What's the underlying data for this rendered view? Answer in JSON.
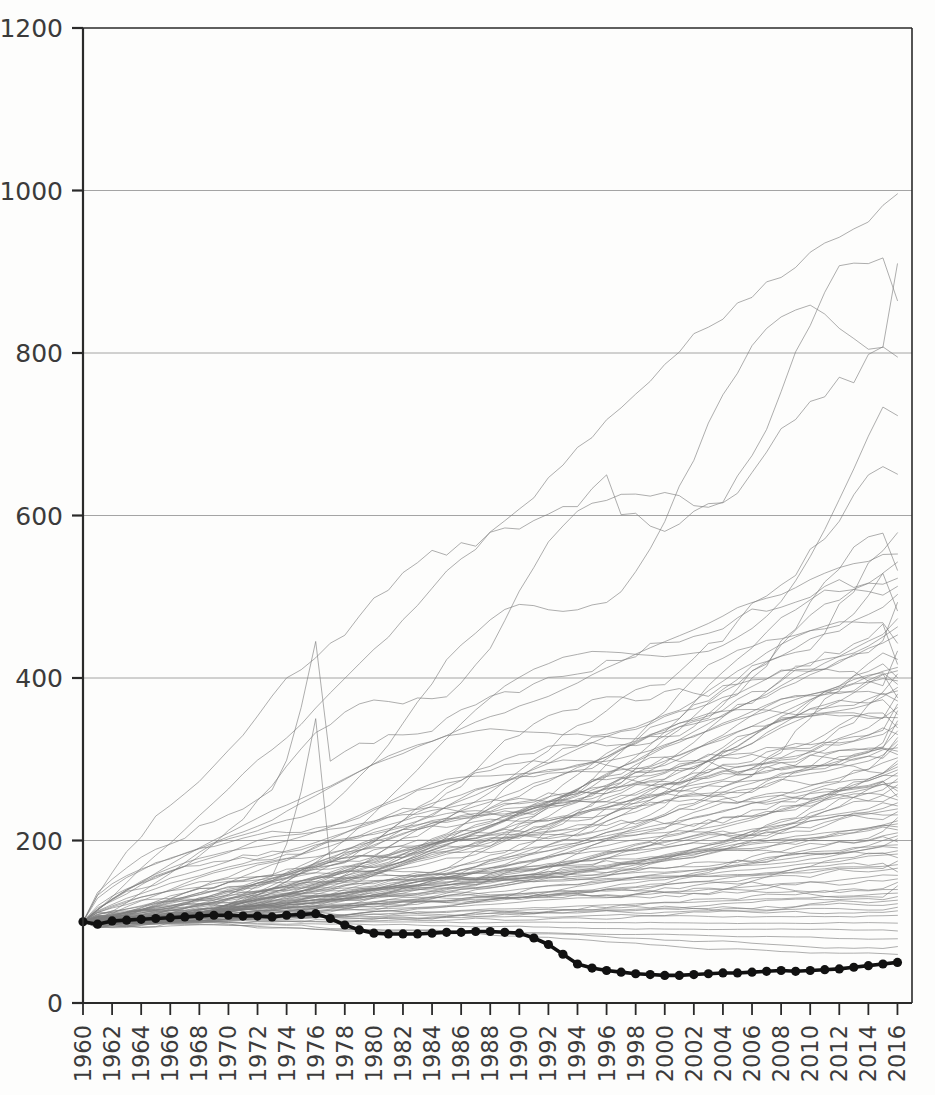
{
  "chart_data": {
    "type": "line",
    "title": "",
    "subtitle": "",
    "xlabel": "",
    "ylabel": "",
    "xlim": [
      1960,
      2017
    ],
    "ylim": [
      0,
      1200
    ],
    "yticks": [
      0,
      200,
      400,
      600,
      800,
      1000,
      1200
    ],
    "ytick_labels": [
      "0",
      "200",
      "400",
      "600",
      "800",
      "1000",
      "1200"
    ],
    "xticks": [
      1960,
      1962,
      1964,
      1966,
      1968,
      1970,
      1972,
      1974,
      1976,
      1978,
      1980,
      1982,
      1984,
      1986,
      1988,
      1990,
      1992,
      1994,
      1996,
      1998,
      2000,
      2002,
      2004,
      2006,
      2008,
      2010,
      2012,
      2014,
      2016
    ],
    "xtick_labels": [
      "1960",
      "1962",
      "1964",
      "1966",
      "1968",
      "1970",
      "1972",
      "1974",
      "1976",
      "1978",
      "1980",
      "1982",
      "1984",
      "1986",
      "1988",
      "1990",
      "1992",
      "1994",
      "1996",
      "1998",
      "2000",
      "2002",
      "2004",
      "2006",
      "2008",
      "2010",
      "2012",
      "2014",
      "2016"
    ],
    "xtick_rotation": 90,
    "grid": "horizontal",
    "grid_color": "#9a9a9a",
    "axis_color": "#2a2a2a",
    "background_color": "#fdfdfc",
    "index_base_year": 1960,
    "index_base_value": 100,
    "x": [
      1960,
      1961,
      1962,
      1963,
      1964,
      1965,
      1966,
      1967,
      1968,
      1969,
      1970,
      1971,
      1972,
      1973,
      1974,
      1975,
      1976,
      1977,
      1978,
      1979,
      1980,
      1981,
      1982,
      1983,
      1984,
      1985,
      1986,
      1987,
      1988,
      1989,
      1990,
      1991,
      1992,
      1993,
      1994,
      1995,
      1996,
      1997,
      1998,
      1999,
      2000,
      2001,
      2002,
      2003,
      2004,
      2005,
      2006,
      2007,
      2008,
      2009,
      2010,
      2011,
      2012,
      2013,
      2014,
      2015,
      2016
    ],
    "highlight_series": {
      "name": "highlighted-series",
      "color": "#111111",
      "line_width": 3.6,
      "marker": "circle",
      "marker_size": 4.6,
      "values": [
        100,
        97,
        101,
        102,
        103,
        104,
        105,
        106,
        107,
        108,
        108,
        107,
        107,
        106,
        108,
        109,
        110,
        104,
        96,
        90,
        86,
        85,
        85,
        85,
        86,
        87,
        87,
        88,
        88,
        87,
        86,
        80,
        72,
        60,
        48,
        43,
        40,
        38,
        36,
        35,
        34,
        34,
        35,
        36,
        37,
        37,
        38,
        39,
        40,
        39,
        40,
        41,
        42,
        44,
        46,
        48,
        50
      ]
    },
    "background_series": {
      "color": "#7d7d7d",
      "line_width": 1.0,
      "opacity": 0.62,
      "count": 104,
      "description": "grey spaghetti lines all indexed to 100 at 1960, fanning upward",
      "envelope_notes": {
        "max_2016": 1080,
        "second_2016": 940,
        "third_2016": 860,
        "median_2016": 300,
        "min_2016": 55,
        "notable_spike_year": 1976,
        "notable_spike_value": 445,
        "secondary_spike_year": 1996,
        "secondary_spike_value": 650
      }
    }
  },
  "figure": {
    "plot_left": 83,
    "plot_right": 912,
    "plot_top": 28,
    "plot_bottom": 1003
  }
}
